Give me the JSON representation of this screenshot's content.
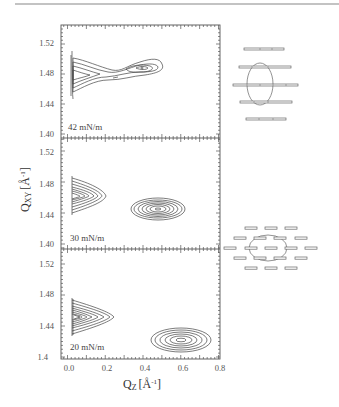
{
  "chart_data": {
    "type": "heatmap",
    "subtype": "contour",
    "title": "",
    "xlabel": "Q_Z [Å^-1]",
    "ylabel": "Q_XY [Å^-1]",
    "xlim": [
      -0.03,
      0.81
    ],
    "x_ticks": [
      "0.0",
      "0.2",
      "0.4",
      "0.6",
      "0.8"
    ],
    "shared_x": true,
    "panels": [
      {
        "label": "42 mN/m",
        "ylim": [
          1.395,
          1.545
        ],
        "y_ticks": [
          "1.40",
          "1.44",
          "1.48",
          "1.52"
        ],
        "peaks": [
          {
            "qz_center": 0.03,
            "qxy_center": 1.478,
            "shape": "elongated streak toward higher Qz",
            "contours": 7
          },
          {
            "qz_center": 0.36,
            "qxy_center": 1.488,
            "shape": "broad elliptical",
            "contours": 4
          }
        ],
        "schematic": "untilted rectangular lattice: five rows of horizontal rods with vertical ellipse"
      },
      {
        "label": "30 mN/m",
        "ylim": [
          1.395,
          1.545
        ],
        "y_ticks": [
          "1.40",
          "1.44",
          "1.48",
          "1.52"
        ],
        "peaks": [
          {
            "qz_center": 0.04,
            "qxy_center": 1.463,
            "shape": "half-ellipse at Qz=0",
            "contours": 9
          },
          {
            "qz_center": 0.45,
            "qxy_center": 1.451,
            "shape": "elliptical",
            "contours": 7
          }
        ],
        "schematic": "tilted lattice: grid of short rods with horizontal ellipse"
      },
      {
        "label": "20 mN/m",
        "ylim": [
          1.4,
          1.545
        ],
        "y_ticks": [
          "1.4",
          "1.44",
          "1.48",
          "1.52"
        ],
        "peaks": [
          {
            "qz_center": 0.04,
            "qxy_center": 1.456,
            "shape": "half-ellipse at Qz=0",
            "contours": 10
          },
          {
            "qz_center": 0.59,
            "qxy_center": 1.422,
            "shape": "elliptical",
            "contours": 6
          }
        ]
      }
    ],
    "grid": false,
    "legend": null
  },
  "axes": {
    "x_ticks": [
      "0.0",
      "0.2",
      "0.4",
      "0.6",
      "0.8"
    ],
    "xlabel_main": "Q",
    "xlabel_sub": "Z",
    "xlabel_unit": "[Å",
    "xlabel_exp": "-1",
    "xlabel_close": "]",
    "ylabel_main": "Q",
    "ylabel_sub": "XY",
    "ylabel_unit": "[Å",
    "ylabel_exp": "-1",
    "ylabel_close": "]"
  },
  "panels": [
    {
      "label": "42 mN/m",
      "y_ticks": [
        "1.52",
        "1.48",
        "1.44",
        "1.40"
      ]
    },
    {
      "label": "30 mN/m",
      "y_ticks": [
        "1.52",
        "1.48",
        "1.44",
        "1.40"
      ]
    },
    {
      "label": "20 mN/m",
      "y_ticks": [
        "1.52",
        "1.48",
        "1.44",
        "1.4"
      ]
    }
  ]
}
